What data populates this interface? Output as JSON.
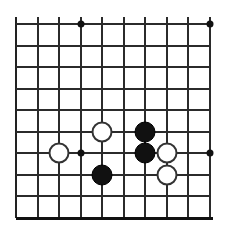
{
  "board": {
    "kind": "go-board-diagram",
    "title": "Go board position",
    "geometry": {
      "image_width": 228,
      "image_height": 231,
      "origin_x": 16,
      "origin_y": 24,
      "cell_size": 21.5,
      "columns": 10,
      "rows": 10,
      "line_overhang_top": 7,
      "line_overhang_bottom": 0
    },
    "colors": {
      "background": "#ffffff",
      "line": "#2b2b2b",
      "edge": "#111111",
      "black_stone": "#111111",
      "white_stone": "#ffffff",
      "white_stone_border": "#333333",
      "star_point": "#111111"
    },
    "star_points": [
      {
        "name": "star-point-top-left",
        "col": 3,
        "row": 0
      },
      {
        "name": "star-point-top-right",
        "col": 9,
        "row": 0
      },
      {
        "name": "star-point-middle-left",
        "col": 3,
        "row": 6
      },
      {
        "name": "star-point-middle-right",
        "col": 9,
        "row": 6
      }
    ],
    "stones": [
      {
        "name": "white-stone-1",
        "color": "white",
        "col": 4,
        "row": 5,
        "label": "W"
      },
      {
        "name": "black-stone-1",
        "color": "black",
        "col": 6,
        "row": 5,
        "label": "B"
      },
      {
        "name": "black-stone-2",
        "color": "black",
        "col": 6,
        "row": 6,
        "label": "B"
      },
      {
        "name": "white-stone-2",
        "color": "white",
        "col": 7,
        "row": 6,
        "label": "W"
      },
      {
        "name": "white-stone-3",
        "color": "white",
        "col": 2,
        "row": 6,
        "label": "W"
      },
      {
        "name": "black-stone-3",
        "color": "black",
        "col": 4,
        "row": 7,
        "label": "B"
      },
      {
        "name": "white-stone-4",
        "color": "white",
        "col": 7,
        "row": 7,
        "label": "W"
      }
    ],
    "stone_radius": 10.5,
    "counts": {
      "black_stones": 3,
      "white_stones": 4,
      "total_stones": 7
    }
  }
}
